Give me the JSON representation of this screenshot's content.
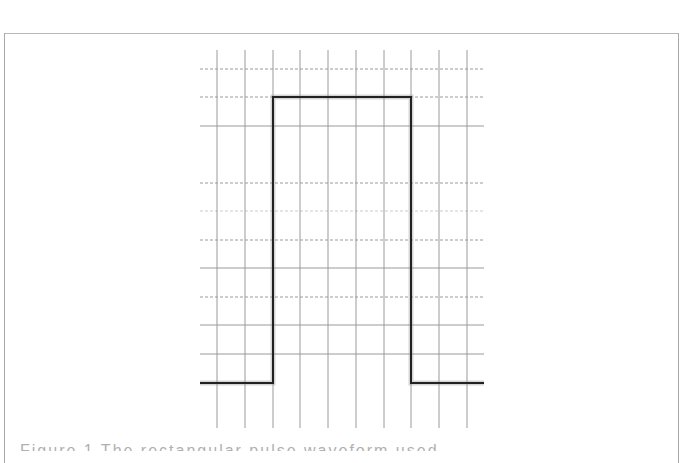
{
  "figure": {
    "type": "rectangular-pulse-waveform",
    "frame": {
      "left": 4,
      "top": 33,
      "right": 679
    },
    "grid": {
      "x_start": 200,
      "x_end": 484,
      "y_start": 50,
      "y_end": 428,
      "vertical_lines_x": [
        217,
        245,
        273,
        300,
        328,
        356,
        384,
        411,
        439,
        467
      ],
      "horizontal_lines": [
        {
          "y": 69,
          "style": "dashed"
        },
        {
          "y": 97,
          "style": "dashed"
        },
        {
          "y": 126,
          "style": "solid"
        },
        {
          "y": 183,
          "style": "dashed"
        },
        {
          "y": 211,
          "style": "dashed-faint"
        },
        {
          "y": 240,
          "style": "dashed"
        },
        {
          "y": 268,
          "style": "solid"
        },
        {
          "y": 297,
          "style": "dashed"
        },
        {
          "y": 325,
          "style": "solid"
        },
        {
          "y": 354,
          "style": "solid"
        }
      ],
      "color": "#9a9a9a"
    },
    "signal": {
      "low_y": 383,
      "high_y": 97,
      "rise_x": 273,
      "fall_x": 411,
      "start_x": 200,
      "end_x": 484,
      "color": "#222222",
      "points": [
        [
          200,
          383
        ],
        [
          273,
          383
        ],
        [
          273,
          97
        ],
        [
          411,
          97
        ],
        [
          411,
          383
        ],
        [
          484,
          383
        ]
      ]
    }
  },
  "caption": {
    "text": "Figure 1  The rectangular pulse waveform used"
  }
}
